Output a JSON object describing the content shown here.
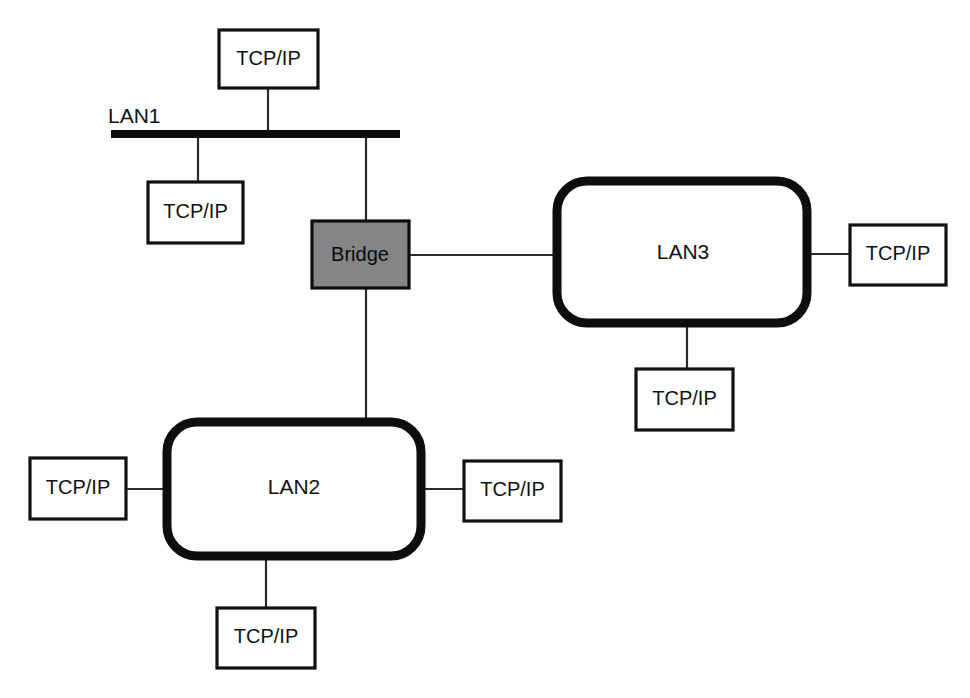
{
  "diagram": {
    "type": "network-topology",
    "canvas": {
      "width": 970,
      "height": 698,
      "background": "#ffffff"
    },
    "colors": {
      "line": "#2b2b2b",
      "outline": "#0d0d0d",
      "bridge_fill": "#858585",
      "host_fill": "#ffffff",
      "text": "#111111"
    },
    "nodes": {
      "lan1": {
        "label": "LAN1",
        "shape": "bus-bar"
      },
      "lan2": {
        "label": "LAN2",
        "shape": "rounded-rect"
      },
      "lan3": {
        "label": "LAN3",
        "shape": "rounded-rect"
      },
      "bridge": {
        "label": "Bridge",
        "shape": "filled-rect"
      }
    },
    "hosts": {
      "lan1_top": {
        "label": "TCP/IP"
      },
      "lan1_left": {
        "label": "TCP/IP"
      },
      "lan2_left": {
        "label": "TCP/IP"
      },
      "lan2_right": {
        "label": "TCP/IP"
      },
      "lan2_bottom": {
        "label": "TCP/IP"
      },
      "lan3_right": {
        "label": "TCP/IP"
      },
      "lan3_bottom": {
        "label": "TCP/IP"
      }
    },
    "links": [
      {
        "from": "lan1_top",
        "to": "lan1"
      },
      {
        "from": "lan1_left",
        "to": "lan1"
      },
      {
        "from": "lan1",
        "to": "bridge"
      },
      {
        "from": "bridge",
        "to": "lan3"
      },
      {
        "from": "bridge",
        "to": "lan2"
      },
      {
        "from": "lan2_left",
        "to": "lan2"
      },
      {
        "from": "lan2_right",
        "to": "lan2"
      },
      {
        "from": "lan2_bottom",
        "to": "lan2"
      },
      {
        "from": "lan3_right",
        "to": "lan3"
      },
      {
        "from": "lan3_bottom",
        "to": "lan3"
      }
    ]
  }
}
